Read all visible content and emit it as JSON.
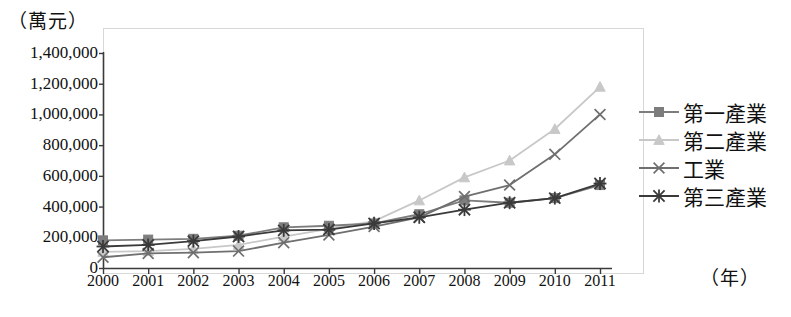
{
  "chart_data": {
    "type": "line",
    "title": "",
    "xlabel": "（年）",
    "ylabel": "（萬元）",
    "x": [
      2000,
      2001,
      2002,
      2003,
      2004,
      2005,
      2006,
      2007,
      2008,
      2009,
      2010,
      2011
    ],
    "xtick_labels": [
      "2000",
      "2001",
      "2002",
      "2003",
      "2004",
      "2005",
      "2006",
      "2007",
      "2008",
      "2009",
      "2010",
      "2011"
    ],
    "ytick_labels": [
      "0",
      "200,000",
      "400,000",
      "600,000",
      "800,000",
      "1,000,000",
      "1,200,000",
      "1,400,000"
    ],
    "ytick_values": [
      0,
      200000,
      400000,
      600000,
      800000,
      1000000,
      1200000,
      1400000
    ],
    "ylim": [
      0,
      1400000
    ],
    "xlim": [
      2000,
      2011
    ],
    "grid": false,
    "legend_position": "right",
    "series": [
      {
        "name": "第一產業",
        "marker": "square",
        "color": "#7d7d7d",
        "values": [
          180000,
          185000,
          190000,
          210000,
          265000,
          275000,
          290000,
          350000,
          440000,
          425000,
          455000,
          540000
        ]
      },
      {
        "name": "第二產業",
        "marker": "triangle",
        "color": "#c8c8c8",
        "values": [
          105000,
          110000,
          125000,
          150000,
          205000,
          255000,
          305000,
          440000,
          590000,
          700000,
          905000,
          1180000
        ]
      },
      {
        "name": "工業",
        "marker": "x",
        "color": "#6f6f6f",
        "values": [
          70000,
          95000,
          100000,
          110000,
          165000,
          215000,
          270000,
          330000,
          465000,
          540000,
          740000,
          1000000
        ]
      },
      {
        "name": "第三產業",
        "marker": "asterisk",
        "color": "#3a3a3a",
        "values": [
          140000,
          150000,
          175000,
          205000,
          245000,
          250000,
          290000,
          330000,
          380000,
          425000,
          455000,
          550000
        ]
      }
    ]
  },
  "legend": {
    "items": [
      {
        "label": "第一產業",
        "marker": "square-marker-icon"
      },
      {
        "label": "第二產業",
        "marker": "triangle-marker-icon"
      },
      {
        "label": "工業",
        "marker": "x-marker-icon"
      },
      {
        "label": "第三產業",
        "marker": "asterisk-marker-icon"
      }
    ]
  }
}
